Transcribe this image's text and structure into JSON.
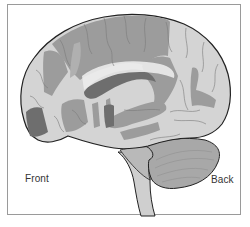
{
  "figure": {
    "labels": {
      "front": "Front",
      "back": "Back"
    },
    "colors": {
      "frame_border": "#9a9a9a",
      "background": "#ffffff",
      "cortex_light": "#d4d4d4",
      "cortex_highlight_medium": "#9c9c9c",
      "cortex_highlight_dark": "#6e6e6e",
      "cerebellum": "#a8a8a8",
      "brainstem": "#cfcfcf",
      "outline": "#222222",
      "sulci": "#7a7a7a"
    }
  }
}
